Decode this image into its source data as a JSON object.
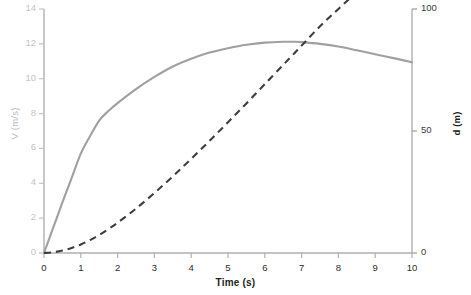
{
  "chart_data": {
    "type": "line",
    "title": "",
    "xlabel": "Time (s)",
    "ylabel": "V (m/s)",
    "y2label": "d (m)",
    "xlim": [
      0,
      10
    ],
    "ylim": [
      0,
      14
    ],
    "y2lim": [
      0,
      100
    ],
    "grid": false,
    "legend": "none",
    "xticks": [
      "0",
      "1",
      "2",
      "3",
      "4",
      "5",
      "6",
      "7",
      "8",
      "9",
      "10"
    ],
    "yticks": [
      "0",
      "2",
      "4",
      "6",
      "8",
      "10",
      "12",
      "14"
    ],
    "y2ticks": [
      "0",
      "50",
      "100"
    ],
    "x": [
      0,
      0.25,
      0.5,
      0.75,
      1,
      1.25,
      1.5,
      1.75,
      2,
      2.5,
      3,
      3.5,
      4,
      4.5,
      5,
      5.5,
      6,
      6.5,
      6.8,
      7,
      7.5,
      8,
      8.5,
      9,
      9.5,
      10
    ],
    "series": [
      {
        "name": "V (m/s)",
        "axis": "left",
        "style": "solid",
        "color": "#a0a0a0",
        "width": 2.1,
        "values": [
          0,
          1.45,
          2.9,
          4.3,
          5.7,
          6.7,
          7.6,
          8.15,
          8.6,
          9.4,
          10.1,
          10.7,
          11.15,
          11.5,
          11.75,
          11.95,
          12.07,
          12.12,
          12.12,
          12.1,
          12.0,
          11.85,
          11.63,
          11.4,
          11.18,
          10.95
        ]
      },
      {
        "name": "d (m)",
        "axis": "right",
        "style": "dashed",
        "color": "#3d3d3d",
        "width": 2.1,
        "values": [
          0,
          0.3,
          1.0,
          2.1,
          3.5,
          5.3,
          7.4,
          9.8,
          12.4,
          18.2,
          24.6,
          31.4,
          38.6,
          46.0,
          53.6,
          61.3,
          69.2,
          77.1,
          81.8,
          85.0,
          92.9,
          100.0,
          107.0,
          114.0,
          120.5,
          127.0
        ]
      }
    ],
    "annotations": {
      "crossing_note": "curves intersect near t = 9 s"
    }
  },
  "axes": {
    "left": {
      "label": "V (m/s)",
      "ticks": [
        "14",
        "12",
        "10",
        "8",
        "6",
        "4",
        "2",
        "0"
      ],
      "color": "#c4c4c4"
    },
    "right": {
      "label": "d (m)",
      "ticks": [
        "100",
        "50",
        "0"
      ],
      "color": "#3a3a3a"
    },
    "bottom": {
      "label": "Time (s)",
      "ticks": [
        "0",
        "1",
        "2",
        "3",
        "4",
        "5",
        "6",
        "7",
        "8",
        "9",
        "10"
      ],
      "color": "#2b2b2b"
    }
  },
  "colors": {
    "velocity_line": "#a0a0a0",
    "distance_line": "#3d3d3d",
    "axis_line": "#b0b0b0",
    "background": "#ffffff"
  }
}
